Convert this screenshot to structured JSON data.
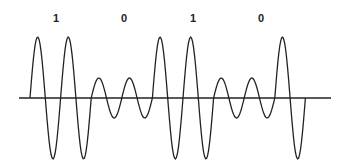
{
  "diagram": {
    "type": "amplitude-shift-keying-waveform",
    "bits": [
      {
        "label": "1",
        "x": 56,
        "cycles": 2,
        "amplitude": "high"
      },
      {
        "label": "0",
        "x": 124,
        "cycles": 2,
        "amplitude": "low"
      },
      {
        "label": "1",
        "x": 193,
        "cycles": 2,
        "amplitude": "high"
      },
      {
        "label": "0",
        "x": 261,
        "cycles": 2,
        "amplitude": "low"
      },
      {
        "label": "",
        "x": 290,
        "cycles": 1,
        "amplitude": "high"
      }
    ],
    "axis": {
      "x_start": 19,
      "x_end": 331,
      "y": 98
    },
    "wave": {
      "x_start": 30,
      "period": 30.6,
      "high_amplitude": 61,
      "low_amplitude": 20,
      "end_drop": true
    },
    "colors": {
      "stroke": "#222222",
      "background": "#ffffff"
    }
  }
}
